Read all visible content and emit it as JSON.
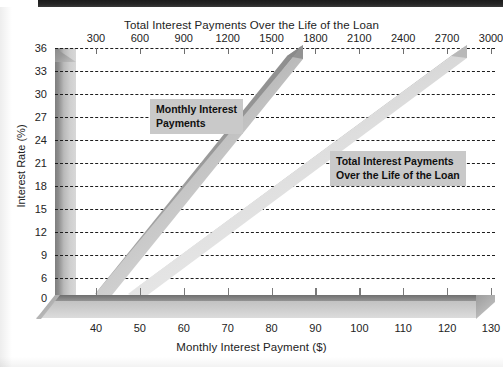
{
  "chart_data": {
    "type": "line",
    "title": "",
    "top_axis": {
      "label": "Total Interest Payments Over the Life of the Loan",
      "ticks": [
        300,
        600,
        900,
        1200,
        1500,
        1800,
        2100,
        2400,
        2700,
        3000
      ],
      "min": 0,
      "max": 3000
    },
    "bottom_axis": {
      "label": "Monthly Interest Payment ($)",
      "ticks": [
        40,
        50,
        60,
        70,
        80,
        90,
        100,
        110,
        120,
        130
      ],
      "min": 33,
      "max": 133
    },
    "y_axis": {
      "label": "Interest Rate (%)",
      "ticks": [
        0,
        6,
        9,
        12,
        15,
        18,
        21,
        24,
        27,
        30,
        33,
        36
      ],
      "min": 0,
      "max": 36
    },
    "grid": true,
    "legend": "inline-annotations",
    "series": [
      {
        "name": "Monthly Interest Payments",
        "axis": "bottom",
        "color": "#9a9a9a",
        "points": [
          {
            "x": 42,
            "y": 1
          },
          {
            "x": 50,
            "y": 6
          },
          {
            "x": 58,
            "y": 12
          },
          {
            "x": 66,
            "y": 18
          },
          {
            "x": 74,
            "y": 24
          },
          {
            "x": 82,
            "y": 30
          },
          {
            "x": 90,
            "y": 36
          }
        ]
      },
      {
        "name": "Total Interest Payments Over the Life of the Loan",
        "axis": "top",
        "color": "#c4c4c4",
        "points": [
          {
            "x": 180,
            "y": 1
          },
          {
            "x": 600,
            "y": 6
          },
          {
            "x": 1100,
            "y": 12
          },
          {
            "x": 1600,
            "y": 18
          },
          {
            "x": 2100,
            "y": 24
          },
          {
            "x": 2600,
            "y": 30
          },
          {
            "x": 3000,
            "y": 36
          }
        ]
      }
    ],
    "annotations": [
      {
        "name": "monthly-interest-payments",
        "text": "Monthly Interest\nPayments",
        "x": 150,
        "y": 99
      },
      {
        "name": "total-interest-payments",
        "text": "Total Interest Payments\nOver the Life of the Loan",
        "x": 330,
        "y": 151
      }
    ]
  },
  "top_axis_title": "Total Interest Payments Over the Life of the Loan",
  "bottom_axis_title": "Monthly Interest Payment ($)",
  "y_axis_title": "Interest Rate (%)",
  "top_ticks": [
    "300",
    "600",
    "900",
    "1200",
    "1500",
    "1800",
    "2100",
    "2400",
    "2700",
    "3000"
  ],
  "bottom_ticks": [
    "40",
    "50",
    "60",
    "70",
    "80",
    "90",
    "100",
    "110",
    "120",
    "130"
  ],
  "y_ticks": [
    "36",
    "33",
    "30",
    "27",
    "24",
    "21",
    "18",
    "15",
    "12",
    "9",
    "6",
    "0"
  ],
  "label_monthly_line1": "Monthly Interest",
  "label_monthly_line2": "Payments",
  "label_total_line1": "Total Interest Payments",
  "label_total_line2": "Over the Life of the Loan",
  "colors": {
    "grid": "#1d1d1d",
    "band_monthly": "#9a9a9a",
    "band_total": "#c4c4c4",
    "wall": "#b9b9b9",
    "floor": "#828282",
    "label_bg": "#c9c9c9",
    "text": "#232323"
  }
}
